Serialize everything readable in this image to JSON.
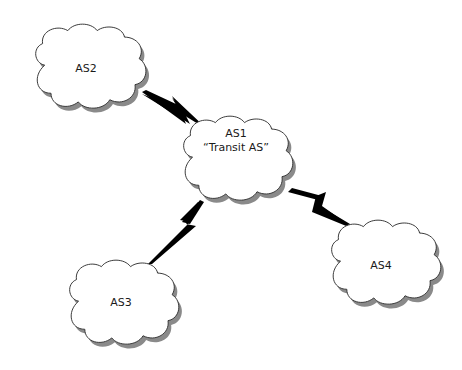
{
  "diagram": {
    "type": "network-topology",
    "nodes": [
      {
        "id": "AS2",
        "label": "AS2",
        "sublabel": ""
      },
      {
        "id": "AS1",
        "label": "AS1",
        "sublabel": "“Transit AS”"
      },
      {
        "id": "AS3",
        "label": "AS3",
        "sublabel": ""
      },
      {
        "id": "AS4",
        "label": "AS4",
        "sublabel": ""
      }
    ],
    "links": [
      {
        "from": "AS2",
        "to": "AS1",
        "style": "lightning"
      },
      {
        "from": "AS1",
        "to": "AS3",
        "style": "lightning"
      },
      {
        "from": "AS1",
        "to": "AS4",
        "style": "lightning"
      }
    ],
    "colors": {
      "cloud_fill": "#ffffff",
      "cloud_stroke": "#333333",
      "shadow": "#8a8a8a",
      "link": "#000000"
    }
  }
}
